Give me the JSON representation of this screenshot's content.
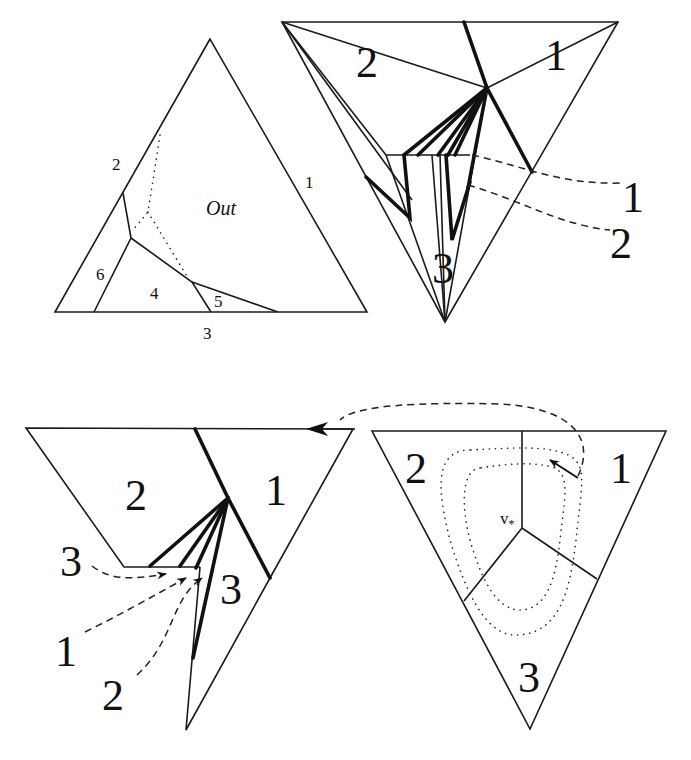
{
  "figure": {
    "panels": [
      {
        "id": "top-left",
        "description": "Triangle subdivided into regions",
        "region_labels": {
          "out": "Out",
          "r1": "1",
          "r2": "2",
          "r3": "3",
          "r4": "4",
          "r5": "5",
          "r6": "6"
        }
      },
      {
        "id": "top-right",
        "description": "Inverted triangle with fan of thick edges from central vertex",
        "region_labels": {
          "r1": "1",
          "r2": "2",
          "r3": "3"
        },
        "callout_labels": {
          "c1": "1",
          "c2": "2"
        }
      },
      {
        "id": "bottom-left",
        "description": "Partial triangle with fan of thick edges and dashed callouts",
        "region_labels": {
          "r1": "1",
          "r2": "2",
          "r3": "3"
        },
        "callout_labels": {
          "c3": "3",
          "c1": "1",
          "c2": "2"
        }
      },
      {
        "id": "bottom-right",
        "description": "Inverted triangle split into three regions meeting at v*, with dotted loops",
        "region_labels": {
          "r1": "1",
          "r2": "2",
          "r3": "3"
        },
        "vertex_label": "v",
        "vertex_subscript": "*"
      }
    ]
  }
}
